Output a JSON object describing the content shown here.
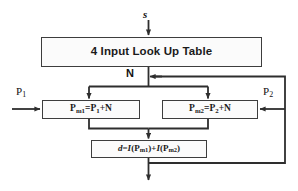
{
  "diagram": {
    "line_color": "#3d3d3d",
    "box_fill": "#fbfbfb",
    "text_color": "#1a1a1a",
    "nodes": {
      "lut": {
        "label": "4 Input Look Up Table"
      },
      "pm1": {
        "label": "Pm1=P1+N",
        "base_left": "P",
        "sub_left": "m1",
        "eq": "=",
        "base_right": "P",
        "sub_right": "1",
        "plus_n": "+N"
      },
      "pm2": {
        "label": "Pm2=P2+N",
        "base_left": "P",
        "sub_left": "m2",
        "eq": "=",
        "base_right": "P",
        "sub_right": "2",
        "plus_n": "+N"
      },
      "d": {
        "label": "d=I(Pm1)+I(Pm2)",
        "d_sym": "d",
        "eq": "=",
        "i_sym": "I",
        "open": "(",
        "p": "P",
        "sub1": "m1",
        "close": ")",
        "plus": "+",
        "sub2": "m2"
      }
    },
    "labels": {
      "s": "s",
      "n": "N",
      "p1_base": "P",
      "p1_sub": "1",
      "p2_base": "P",
      "p2_sub": "2"
    }
  }
}
